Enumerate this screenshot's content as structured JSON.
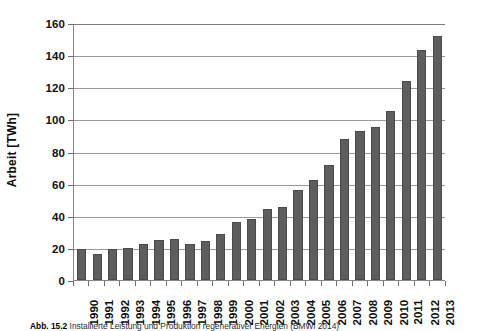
{
  "figure": {
    "caption_number": "Abb. 15.2",
    "caption_text": "Installierte Leistung und Produktion regenerativer Energien (BMWi 2014)"
  },
  "chart_data": {
    "type": "bar",
    "title": "",
    "xlabel": "",
    "ylabel": "Arbeit [TWh]",
    "ylim": [
      0,
      160
    ],
    "ytick_step": 20,
    "yticks": [
      0,
      20,
      40,
      60,
      80,
      100,
      120,
      140,
      160
    ],
    "ytick_labels": [
      "0",
      "20",
      "40",
      "60",
      "80",
      "100",
      "120",
      "140",
      "160"
    ],
    "grid": true,
    "legend": "none",
    "bar_color": "#5e5e5e",
    "categories": [
      "1990",
      "1991",
      "1992",
      "1993",
      "1994",
      "1995",
      "1996",
      "1997",
      "1998",
      "1999",
      "2000",
      "2001",
      "2002",
      "2003",
      "2004",
      "2005",
      "2006",
      "2007",
      "2008",
      "2009",
      "2010",
      "2011",
      "2012",
      "2013"
    ],
    "values": [
      19,
      16.5,
      19.5,
      20,
      22.5,
      25,
      25.5,
      22.5,
      24.5,
      28.5,
      36,
      38,
      44,
      45.5,
      56,
      62,
      71.5,
      88,
      93,
      95,
      105,
      124,
      143,
      152
    ]
  }
}
